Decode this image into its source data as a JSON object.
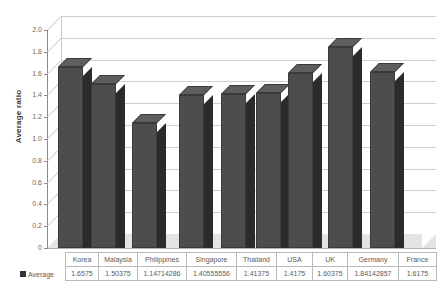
{
  "chart_data": {
    "type": "bar",
    "title": "",
    "xlabel": "",
    "ylabel": "Average ratio",
    "ylim": [
      0,
      2.0
    ],
    "ytick_step": 0.2,
    "grid": true,
    "legend_position": "bottom-left",
    "style": "3d-column",
    "series_name": "Average",
    "categories": [
      "Korea",
      "Malaysia",
      "Philippines",
      "Singapore",
      "Thailand",
      "USA",
      "UK",
      "Germany",
      "France"
    ],
    "values": [
      1.6575,
      1.50375,
      1.14714286,
      1.40555556,
      1.41375,
      1.4175,
      1.60375,
      1.84142857,
      1.6175
    ],
    "value_labels": [
      "1.6575",
      "1.50375",
      "1.14714286",
      "1.40555556",
      "1.41375",
      "1.4175",
      "1.60375",
      "1.84142857",
      "1.6175"
    ],
    "ytick_labels": [
      "0",
      "0.2",
      "0.4",
      "0.6",
      "0.8",
      "1.0",
      "1.2",
      "1.4",
      "1.6",
      "1.8",
      "2.0"
    ],
    "colors": {
      "bar_front": "#4d4d4d",
      "bar_side": "#2b2b2b",
      "bar_top": "#5e5e5e",
      "gridline": "#cfcfcf",
      "floor": "#e4e4e4",
      "axis": "#8a8a8a",
      "text": "#5a5a5a",
      "legend_marker": "#333333"
    }
  },
  "axis": {
    "ylabel": "Average ratio",
    "ticks": [
      "2.0",
      "1.8",
      "1.6",
      "1.4",
      "1.2",
      "1.0",
      "0.8",
      "0.6",
      "0.4",
      "0.2",
      "0"
    ]
  },
  "legend": {
    "marker_name": "legend-marker",
    "label": "Average"
  },
  "table": {
    "header": [
      "Korea",
      "Malaysia",
      "Philippines",
      "Singapore",
      "Thailand",
      "USA",
      "UK",
      "Germany",
      "France"
    ],
    "row_label": "Average",
    "row": [
      "1.6575",
      "1.50375",
      "1.14714286",
      "1.40555556",
      "1.41375",
      "1.4175",
      "1.60375",
      "1.84142857",
      "1.6175"
    ]
  }
}
